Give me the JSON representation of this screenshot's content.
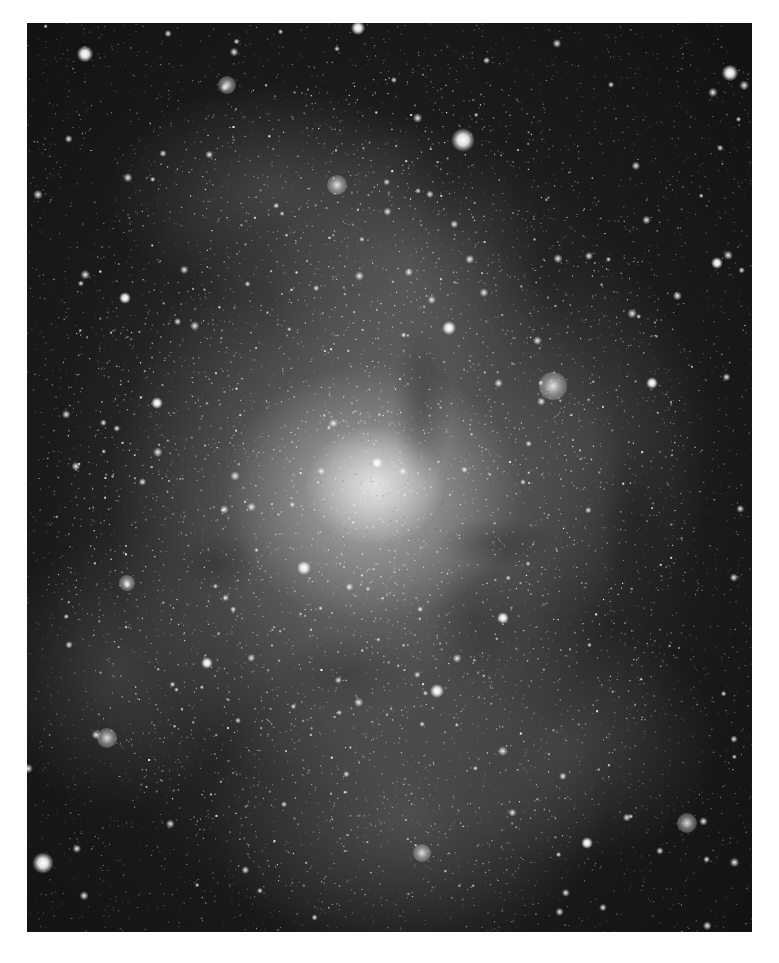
{
  "image": {
    "subject": "Spiral galaxy (grayscale astronomical photograph)",
    "frame": {
      "left": 27,
      "top": 23,
      "width": 725,
      "height": 909
    },
    "page_background": "#ffffff",
    "sky_color": "#1c1c1c",
    "core_position": [
      348,
      462
    ],
    "star_field": {
      "seed": 33,
      "faint_count": 5200,
      "cluster_count": 2600
    },
    "bright_stars": [
      {
        "x": 436,
        "y": 117,
        "r": 5
      },
      {
        "x": 58,
        "y": 31,
        "r": 3.5
      },
      {
        "x": 703,
        "y": 50,
        "r": 3.5
      },
      {
        "x": 16,
        "y": 840,
        "r": 4.5
      },
      {
        "x": 331,
        "y": 5,
        "r": 3
      },
      {
        "x": 422,
        "y": 305,
        "r": 3
      },
      {
        "x": 277,
        "y": 545,
        "r": 3
      },
      {
        "x": 410,
        "y": 668,
        "r": 3
      },
      {
        "x": 130,
        "y": 380,
        "r": 2.5
      },
      {
        "x": 690,
        "y": 240,
        "r": 2.5
      },
      {
        "x": 180,
        "y": 640,
        "r": 2.5
      },
      {
        "x": 476,
        "y": 595,
        "r": 2.5
      },
      {
        "x": 350,
        "y": 440,
        "r": 2.5
      },
      {
        "x": 560,
        "y": 820,
        "r": 2.5
      },
      {
        "x": 98,
        "y": 275,
        "r": 2.5
      },
      {
        "x": 625,
        "y": 360,
        "r": 2.5
      }
    ],
    "hii_regions": [
      {
        "x": 526,
        "y": 363,
        "r": 14,
        "label": "bright nebula knot"
      },
      {
        "x": 310,
        "y": 162,
        "r": 10,
        "label": "northern arm knot"
      },
      {
        "x": 200,
        "y": 62,
        "r": 9,
        "label": "upper arm cluster"
      },
      {
        "x": 100,
        "y": 560,
        "r": 8,
        "label": "western arm cluster"
      },
      {
        "x": 80,
        "y": 715,
        "r": 10,
        "label": "southwest arm cluster"
      },
      {
        "x": 660,
        "y": 800,
        "r": 10,
        "label": "southeast cluster"
      },
      {
        "x": 395,
        "y": 830,
        "r": 9,
        "label": "southern arm cluster"
      }
    ]
  }
}
